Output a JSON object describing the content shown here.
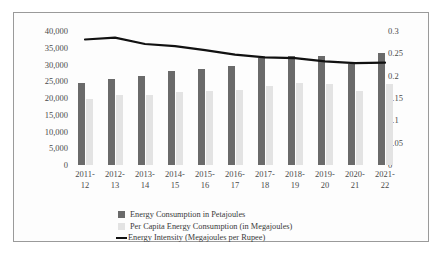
{
  "chart_data": {
    "type": "bar",
    "title": "",
    "xlabel": "",
    "ylabel": "",
    "y2label": "",
    "grid": false,
    "legend_position": "bottom",
    "categories": [
      "2011-12",
      "2012-13",
      "2013-14",
      "2014-15",
      "2015-16",
      "2016-17",
      "2017-18",
      "2018-19",
      "2019-20",
      "2020-21",
      "2021-22"
    ],
    "category_lines": [
      [
        "2011-",
        "12"
      ],
      [
        "2012-",
        "13"
      ],
      [
        "2013-",
        "14"
      ],
      [
        "2014-",
        "15"
      ],
      [
        "2015-",
        "16"
      ],
      [
        "2016-",
        "17"
      ],
      [
        "2017-",
        "18"
      ],
      [
        "2018-",
        "19"
      ],
      [
        "2019-",
        "20"
      ],
      [
        "2020-",
        "21"
      ],
      [
        "2021-",
        "22"
      ]
    ],
    "ylim": [
      0,
      40000
    ],
    "y2lim": [
      0,
      0.3
    ],
    "yticks": [
      "40,000",
      "35,000",
      "30,000",
      "25,000",
      "20,000",
      "15,000",
      "10,000",
      "5,000",
      "0"
    ],
    "ytick_values": [
      40000,
      35000,
      30000,
      25000,
      20000,
      15000,
      10000,
      5000,
      0
    ],
    "y2ticks": [
      "0.3",
      "0.25",
      "0.2",
      "0.15",
      "0.1",
      "0.05",
      "0"
    ],
    "y2tick_values": [
      0.3,
      0.25,
      0.2,
      0.15,
      0.1,
      0.05,
      0
    ],
    "series": [
      {
        "name": "Energy Consumption in Petajoules",
        "type": "bar",
        "axis": "left",
        "color": "#6a6a6a",
        "values": [
          24400,
          25800,
          26500,
          28000,
          28800,
          29700,
          31800,
          32600,
          32600,
          30200,
          33500
        ]
      },
      {
        "name": "Per Capita Energy Consumption (in Megajoules)",
        "type": "bar",
        "axis": "left",
        "color": "#e3e3e3",
        "values": [
          19800,
          20800,
          21000,
          21800,
          22000,
          22400,
          23500,
          24400,
          24300,
          22200,
          24300
        ]
      },
      {
        "name": "Energy Intensity (Megajoules per Rupee)",
        "type": "line",
        "axis": "right",
        "color": "#111111",
        "values": [
          0.281,
          0.285,
          0.271,
          0.266,
          0.257,
          0.247,
          0.241,
          0.239,
          0.232,
          0.228,
          0.229
        ]
      }
    ]
  },
  "legend": {
    "items": [
      {
        "label": "Energy Consumption in Petajoules",
        "marker": "square-dark"
      },
      {
        "label": "Per Capita Energy Consumption (in Megajoules)",
        "marker": "square-light"
      },
      {
        "label": "Energy Intensity (Megajoules per Rupee)",
        "marker": "line-black"
      }
    ]
  }
}
